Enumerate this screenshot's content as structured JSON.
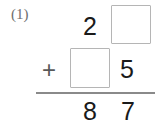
{
  "problem": {
    "number_label": "(1)",
    "operator": "+",
    "type": "vertical-addition-fill-in-the-blank",
    "columns": [
      "tens",
      "ones"
    ],
    "rows": {
      "addend_1": {
        "tens": "2",
        "ones": "",
        "ones_is_blank": true
      },
      "addend_2": {
        "tens": "",
        "tens_is_blank": true,
        "ones": "5"
      },
      "sum": {
        "tens": "8",
        "ones": "7"
      }
    },
    "blank_box_count": 2
  },
  "colors": {
    "background": "#ffffff",
    "digit": "#1a1a1a",
    "operator": "#585858",
    "label": "#6e6e6e",
    "box_border": "#b5b5b5",
    "rule": "#8a8a8a"
  }
}
